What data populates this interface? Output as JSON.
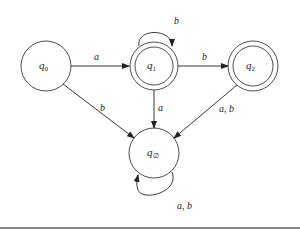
{
  "diagram": {
    "type": "DFA state diagram",
    "states": [
      {
        "id": "q0",
        "label": "q",
        "sub": "0",
        "accepting": false,
        "start": true
      },
      {
        "id": "q1",
        "label": "q",
        "sub": "1",
        "accepting": true
      },
      {
        "id": "q2",
        "label": "q",
        "sub": "2",
        "accepting": true
      },
      {
        "id": "qempty",
        "label": "q",
        "sub": "∅",
        "accepting": false
      }
    ],
    "transitions": [
      {
        "from": "q0",
        "to": "q1",
        "label": "a"
      },
      {
        "from": "q0",
        "to": "qempty",
        "label": "b"
      },
      {
        "from": "q1",
        "to": "q1",
        "label": "b"
      },
      {
        "from": "q1",
        "to": "q2",
        "label": "b"
      },
      {
        "from": "q1",
        "to": "qempty",
        "label": "a"
      },
      {
        "from": "q2",
        "to": "qempty",
        "label": "a, b"
      },
      {
        "from": "qempty",
        "to": "qempty",
        "label": "a, b"
      }
    ]
  },
  "colors": {
    "stroke": "#222222",
    "rule": "#888888"
  }
}
